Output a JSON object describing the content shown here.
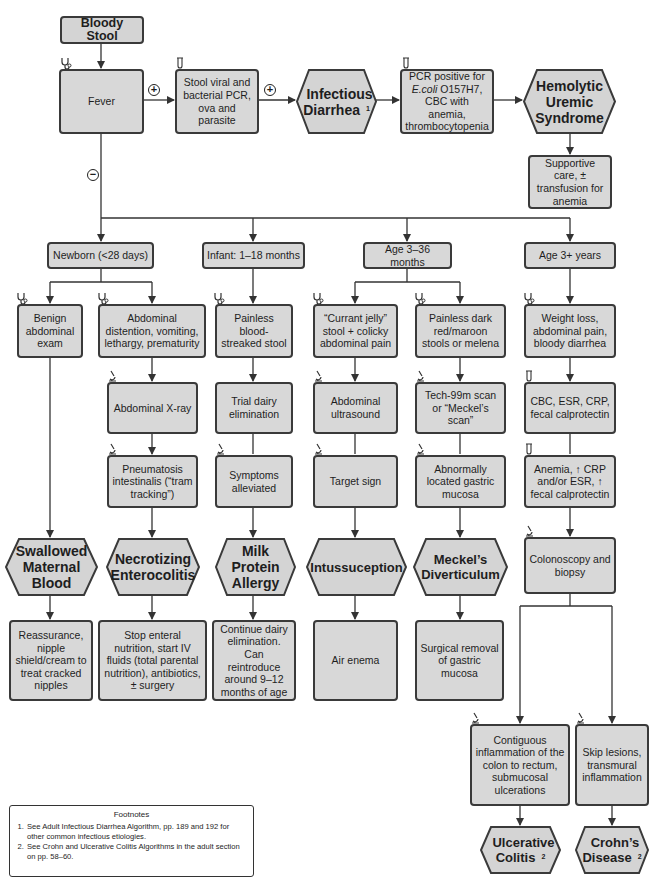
{
  "title": "Bloody Stool",
  "nodes": {
    "fever": "Fever",
    "stool_pcr": "Stool viral and bacterial PCR, ova and parasite",
    "infectious_diarrhea": "Infectious Diarrhea",
    "infectious_diarrhea_note": "1",
    "pcr_positive_pre": "PCR positive for",
    "pcr_positive_ecoli": "E.coli",
    "pcr_positive_post": "O157H7, CBC with anemia, thrombocytopenia",
    "hus": "Hemolytic Uremic Syndrome",
    "supportive_care": "Supportive care, ± transfusion for anemia",
    "age_newborn": "Newborn (<28 days)",
    "age_infant": "Infant: 1–18 months",
    "age_3_36": "Age 3–36 months",
    "age_3plus": "Age 3+ years",
    "benign_exam": "Benign abdominal exam",
    "abd_distention": "Abdominal distention, vomiting, lethargy, prematurity",
    "painless_streaked": "Painless blood-streaked stool",
    "currant_jelly": "“Currant jelly” stool + colicky abdominal pain",
    "painless_dark": "Painless dark red/maroon stools or melena",
    "weight_loss": "Weight loss, abdominal pain, bloody diarrhea",
    "abd_xray": "Abdominal X-ray",
    "trial_dairy": "Trial dairy elimination",
    "abd_us": "Abdominal ultrasound",
    "tech_scan": "Tech-99m scan or “Meckel’s scan”",
    "labs": "CBC, ESR, CRP, fecal calprotectin",
    "pneumatosis": "Pneumatosis intestinalis (“tram tracking”)",
    "symptoms_alleviated": "Symptoms alleviated",
    "target_sign": "Target sign",
    "abnormal_mucosa": "Abnormally located gastric mucosa",
    "anemia": "Anemia, ↑ CRP and/or ESR, ↑ fecal calprotectin",
    "colonoscopy": "Colonoscopy and biopsy",
    "swallowed_blood": "Swallowed Maternal Blood",
    "nec": "Necrotizing Enterocolitis",
    "milk_allergy": "Milk Protein Allergy",
    "intussusception": "Intussuception",
    "meckel": "Meckel’s Diverticulum",
    "reassurance": "Reassurance, nipple shield/cream to treat cracked nipples",
    "stop_enteral": "Stop enteral nutrition, start IV fluids (total parental nutrition), antibiotics, ± surgery",
    "continue_dairy": "Continue dairy elimination. Can reintroduce around 9–12 months of age",
    "air_enema": "Air enema",
    "surgical_removal": "Surgical removal of gastric mucosa",
    "contiguous": "Contiguous inflammation of the colon to rectum, submucosal ulcerations",
    "skip_lesions": "Skip lesions, transmural inflammation",
    "uc": "Ulcerative Colitis",
    "uc_note": "2",
    "crohn": "Crohn’s Disease",
    "crohn_note": "2"
  },
  "signs": {
    "positive": "+",
    "negative": "−"
  },
  "icons": {
    "exam": "stethoscope-icon",
    "lab": "test-tube-icon",
    "imaging": "microscope-icon"
  },
  "footnotes": {
    "title": "Footnotes",
    "items": [
      "See Adult Infectious Diarrhea Algorithm, pp. 189 and 192 for other common infectious etiologies.",
      "See Crohn and Ulcerative Colitis Algorithms in the adult section on pp. 58–60."
    ]
  },
  "colors": {
    "box_fill": "#d8d8d8",
    "border": "#3a3a3a",
    "line": "#333333"
  }
}
